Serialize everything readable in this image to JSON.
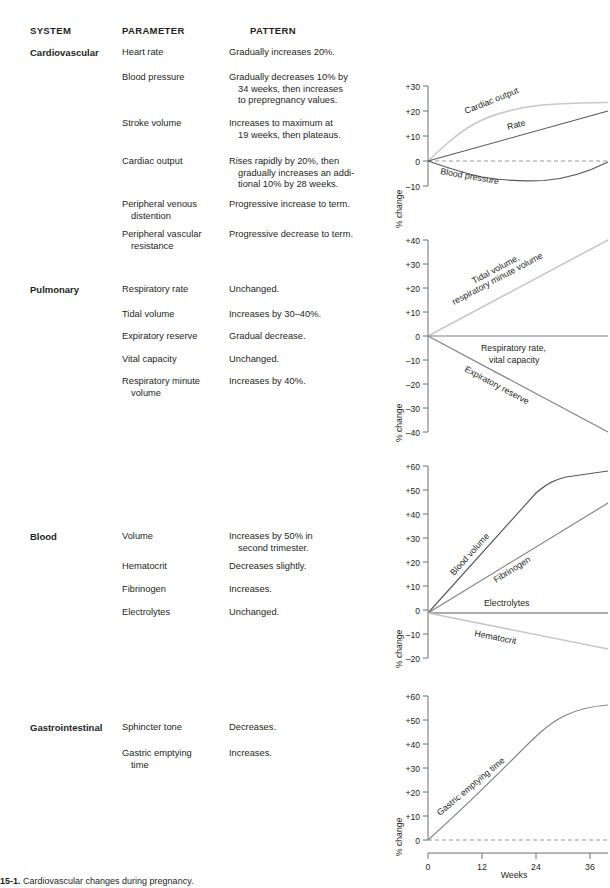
{
  "headers": {
    "system": "SYSTEM",
    "parameter": "PARAMETER",
    "pattern": "PATTERN"
  },
  "caption": {
    "figure_number": "15-1.",
    "text": "Cardiovascular changes during pregnancy."
  },
  "axis_title": "% change",
  "x_axis": {
    "label": "Weeks",
    "ticks": [
      "0",
      "12",
      "24",
      "36"
    ]
  },
  "sections": [
    {
      "system": "Cardiovascular",
      "rows": [
        {
          "parameter": [
            "Heart rate"
          ],
          "pattern": [
            "Gradually increases 20%."
          ]
        },
        {
          "parameter": [
            "Blood pressure"
          ],
          "pattern": [
            "Gradually decreases 10% by",
            "34 weeks, then increases",
            "to prepregnancy values."
          ]
        },
        {
          "parameter": [
            "Stroke volume"
          ],
          "pattern": [
            "Increases to maximum at",
            "19 weeks, then plateaus."
          ]
        },
        {
          "parameter": [
            "Cardiac output"
          ],
          "pattern": [
            "Rises rapidly by 20%, then",
            "gradually increases an addi-",
            "tional 10% by 28 weeks."
          ]
        },
        {
          "parameter": [
            "Peripheral venous",
            "distention"
          ],
          "pattern": [
            "Progressive increase to term."
          ]
        },
        {
          "parameter": [
            "Peripheral vascular",
            "resistance"
          ],
          "pattern": [
            "Progressive decrease to term."
          ]
        }
      ]
    },
    {
      "system": "Pulmonary",
      "rows": [
        {
          "parameter": [
            "Respiratory rate"
          ],
          "pattern": [
            "Unchanged."
          ]
        },
        {
          "parameter": [
            "Tidal volume"
          ],
          "pattern": [
            "Increases by 30–40%."
          ]
        },
        {
          "parameter": [
            "Expiratory reserve"
          ],
          "pattern": [
            "Gradual decrease."
          ]
        },
        {
          "parameter": [
            "Vital capacity"
          ],
          "pattern": [
            "Unchanged."
          ]
        },
        {
          "parameter": [
            "Respiratory minute",
            "volume"
          ],
          "pattern": [
            "Increases by 40%."
          ]
        }
      ]
    },
    {
      "system": "Blood",
      "rows": [
        {
          "parameter": [
            "Volume"
          ],
          "pattern": [
            "Increases by 50% in",
            "second trimester."
          ]
        },
        {
          "parameter": [
            "Hematocrit"
          ],
          "pattern": [
            "Decreases slightly."
          ]
        },
        {
          "parameter": [
            "Fibrinogen"
          ],
          "pattern": [
            "Increases."
          ]
        },
        {
          "parameter": [
            "Electrolytes"
          ],
          "pattern": [
            "Unchanged."
          ]
        }
      ]
    },
    {
      "system": "Gastrointestinal",
      "rows": [
        {
          "parameter": [
            "Sphincter tone"
          ],
          "pattern": [
            "Decreases."
          ]
        },
        {
          "parameter": [
            "Gastric emptying",
            "time"
          ],
          "pattern": [
            "Increases."
          ]
        }
      ]
    }
  ],
  "chart_data": [
    {
      "id": "cardiovascular",
      "type": "line",
      "title": "Cardiovascular",
      "xlabel": "Weeks",
      "ylabel": "% change",
      "xlim": [
        0,
        40
      ],
      "ylim": [
        -10,
        30
      ],
      "yticks": [
        "+30",
        "+20",
        "+10",
        "0",
        "–10"
      ],
      "ytick_values": [
        30,
        20,
        10,
        0,
        -10
      ],
      "zero_reference_dashed": true,
      "series": [
        {
          "name": "Cardiac output",
          "color": "#c7c8ca",
          "x": [
            0,
            4,
            8,
            12,
            16,
            20,
            24,
            28,
            32,
            36,
            40
          ],
          "values": [
            0,
            9,
            16,
            21,
            25,
            27.5,
            29,
            29.8,
            30,
            30,
            30
          ]
        },
        {
          "name": "Rate",
          "color": "#58595b",
          "x": [
            0,
            10,
            20,
            30,
            40
          ],
          "values": [
            0,
            5,
            10,
            15,
            20
          ]
        },
        {
          "name": "Blood pressure",
          "color": "#58595b",
          "x": [
            0,
            4,
            8,
            12,
            16,
            20,
            24,
            28,
            32,
            36,
            40
          ],
          "values": [
            0,
            -2.5,
            -4.5,
            -6,
            -7,
            -7.8,
            -8.2,
            -8.2,
            -7.2,
            -4.5,
            -0.5
          ]
        }
      ]
    },
    {
      "id": "pulmonary",
      "type": "line",
      "title": "Pulmonary",
      "xlabel": "Weeks",
      "ylabel": "% change",
      "xlim": [
        0,
        40
      ],
      "ylim": [
        -40,
        40
      ],
      "yticks": [
        "+40",
        "+30",
        "+20",
        "+10",
        "0",
        "–10",
        "–20",
        "–30",
        "–40"
      ],
      "ytick_values": [
        40,
        30,
        20,
        10,
        0,
        -10,
        -20,
        -30,
        -40
      ],
      "series": [
        {
          "name": "Tidal volume, respiratory minute volume",
          "color": "#c7c8ca",
          "x": [
            0,
            40
          ],
          "values": [
            0,
            40
          ]
        },
        {
          "name": "Respiratory rate, vital capacity",
          "color": "#808285",
          "x": [
            0,
            40
          ],
          "values": [
            0,
            0
          ]
        },
        {
          "name": "Expiratory reserve",
          "color": "#808285",
          "x": [
            0,
            40
          ],
          "values": [
            0,
            -40
          ]
        }
      ]
    },
    {
      "id": "blood",
      "type": "line",
      "title": "Blood",
      "xlabel": "Weeks",
      "ylabel": "% change",
      "xlim": [
        0,
        40
      ],
      "ylim": [
        -20,
        60
      ],
      "yticks": [
        "+60",
        "+50",
        "+40",
        "+30",
        "+20",
        "+10",
        "0",
        "–10",
        "–20"
      ],
      "ytick_values": [
        60,
        50,
        40,
        30,
        20,
        10,
        0,
        -10,
        -20
      ],
      "series": [
        {
          "name": "Blood volume",
          "color": "#58595b",
          "x": [
            0,
            8,
            16,
            22,
            26,
            30,
            34,
            40
          ],
          "values": [
            0,
            16,
            33,
            45,
            50,
            52.5,
            54.5,
            57
          ]
        },
        {
          "name": "Fibrinogen",
          "color": "#808285",
          "x": [
            0,
            40
          ],
          "values": [
            0,
            46
          ]
        },
        {
          "name": "Electrolytes",
          "color": "#58595b",
          "x": [
            0,
            40
          ],
          "values": [
            0,
            0
          ]
        },
        {
          "name": "Hematocrit",
          "color": "#c7c8ca",
          "x": [
            0,
            40
          ],
          "values": [
            0,
            -15
          ]
        }
      ]
    },
    {
      "id": "gastrointestinal",
      "type": "line",
      "title": "Gastrointestinal",
      "xlabel": "Weeks",
      "ylabel": "% change",
      "xlim": [
        0,
        40
      ],
      "ylim": [
        0,
        60
      ],
      "yticks": [
        "+60",
        "+50",
        "+40",
        "+30",
        "+20",
        "+10",
        "0"
      ],
      "ytick_values": [
        60,
        50,
        40,
        30,
        20,
        10,
        0
      ],
      "xticks": [
        "0",
        "12",
        "24",
        "36"
      ],
      "xtick_values": [
        0,
        12,
        24,
        36
      ],
      "zero_reference_dashed": true,
      "series": [
        {
          "name": "Gastric emptying time",
          "color": "#808285",
          "x": [
            0,
            6,
            12,
            18,
            24,
            28,
            32,
            36,
            40
          ],
          "values": [
            0,
            9,
            19,
            28.5,
            38,
            45,
            51,
            54.5,
            56
          ]
        }
      ]
    }
  ]
}
